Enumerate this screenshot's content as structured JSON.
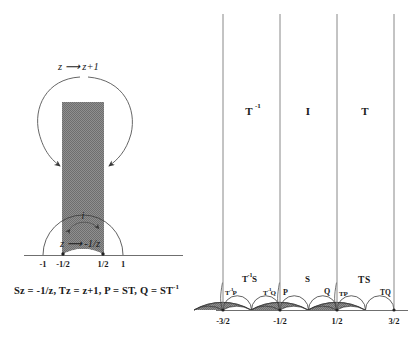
{
  "figure": {
    "background": "#ffffff",
    "shade_color": "#8a8a8a",
    "line_color": "#3a3a3a",
    "axis_color": "#6f6f6f"
  },
  "left_panel": {
    "name": "fundamental-domain-panel",
    "top_arrow_label": "z ⟶ z+1",
    "inner_arrow_label": "z ⟶ -1/z",
    "point_i_label": "i",
    "axis_ticks": [
      {
        "label": "-1",
        "value": -1,
        "x_px": 43,
        "has_dot": false
      },
      {
        "label": "-1/2",
        "value": -0.5,
        "x_px": 63,
        "has_dot": true
      },
      {
        "label": "1/2",
        "value": 0.5,
        "x_px": 103,
        "has_dot": true
      },
      {
        "label": "1",
        "value": 1,
        "x_px": 123,
        "has_dot": false
      }
    ],
    "region": {
      "description": "shaded fundamental domain strip",
      "x_left": -0.5,
      "x_right": 0.5,
      "bottom_arc_radius": 1
    }
  },
  "caption": {
    "text_parts": [
      "Sz = -1/z, Tz = z+1, P = ST, Q = ST",
      "-1"
    ],
    "full": "Sz = -1/z, Tz = z+1, P = ST, Q = ST-1"
  },
  "right_panel": {
    "name": "tessellation-panel",
    "vertical_lines_at": [
      -1.5,
      -0.5,
      0.5,
      1.5
    ],
    "upper_region_labels": [
      {
        "base": "T",
        "exp": "-1",
        "x": -1.0
      },
      {
        "base": "I",
        "exp": "",
        "x": 0.0
      },
      {
        "base": "T",
        "exp": "",
        "x": 1.0
      }
    ],
    "cell_labels": [
      {
        "base": "T",
        "exp": "-1",
        "suffix": "P",
        "x": -1.32,
        "y": 0.2,
        "shaded": true
      },
      {
        "base": "T",
        "exp": "-1",
        "suffix": "S",
        "x": -1.02,
        "y": 0.4,
        "shaded": true
      },
      {
        "base": "T",
        "exp": "-1",
        "suffix": "Q",
        "x": -0.68,
        "y": 0.2,
        "shaded": false
      },
      {
        "base": "",
        "exp": "",
        "suffix": "P",
        "x": -0.32,
        "y": 0.2,
        "shaded": true
      },
      {
        "base": "",
        "exp": "",
        "suffix": "S",
        "x": -0.02,
        "y": 0.4,
        "shaded": true
      },
      {
        "base": "",
        "exp": "",
        "suffix": "Q",
        "x": 0.32,
        "y": 0.2,
        "shaded": false
      },
      {
        "base": "T",
        "exp": "",
        "suffix": "P",
        "x": 0.68,
        "y": 0.2,
        "shaded": true
      },
      {
        "base": "T",
        "exp": "",
        "suffix": "S",
        "x": 0.98,
        "y": 0.4,
        "shaded": true
      },
      {
        "base": "T",
        "exp": "",
        "suffix": "Q",
        "x": 1.32,
        "y": 0.2,
        "shaded": false
      }
    ],
    "axis_ticks": [
      {
        "label": "-3/2",
        "value": -1.5
      },
      {
        "label": "-1/2",
        "value": -0.5
      },
      {
        "label": "1/2",
        "value": 0.5
      },
      {
        "label": "3/2",
        "value": 1.5
      }
    ]
  }
}
